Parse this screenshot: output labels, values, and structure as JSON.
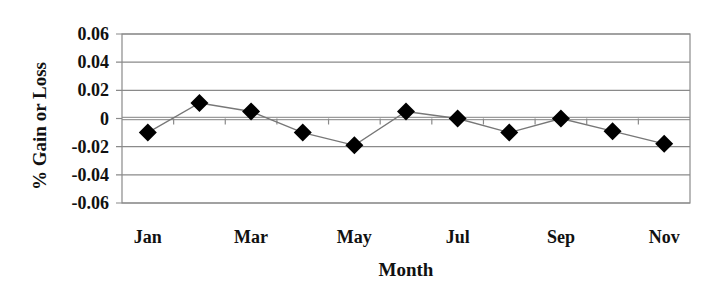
{
  "chart_data": {
    "type": "line",
    "title": "",
    "xlabel": "Month",
    "ylabel": "% Gain or Loss",
    "categories": [
      "Jan",
      "Feb",
      "Mar",
      "Apr",
      "May",
      "Jun",
      "Jul",
      "Aug",
      "Sep",
      "Oct",
      "Nov"
    ],
    "x_tick_labels": [
      "Jan",
      "Mar",
      "May",
      "Jul",
      "Sep",
      "Nov"
    ],
    "series": [
      {
        "name": "% Gain or Loss",
        "marker": "diamond",
        "values": [
          -0.01,
          0.011,
          0.005,
          -0.01,
          -0.019,
          0.005,
          0.0,
          -0.01,
          0.0,
          -0.009,
          -0.018
        ]
      }
    ],
    "ylim": [
      -0.06,
      0.06
    ],
    "y_ticks": [
      0.06,
      0.04,
      0.02,
      0,
      -0.02,
      -0.04,
      -0.06
    ],
    "y_tick_labels": [
      "0.06",
      "0.04",
      "0.02",
      "0",
      "-0.02",
      "-0.04",
      "-0.06"
    ],
    "grid": true,
    "legend": "none"
  },
  "colors": {
    "marker": "#000000",
    "line": "#777777",
    "grid": "#8a8a8a",
    "frame": "#8a8a8a",
    "zero_line": "#9a9a9a",
    "text": "#111111"
  }
}
